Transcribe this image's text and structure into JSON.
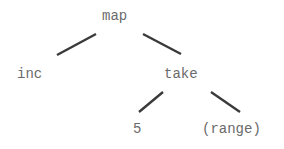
{
  "tree": {
    "nodes": [
      {
        "id": "map",
        "label": "map",
        "x": 102,
        "y": 9
      },
      {
        "id": "inc",
        "label": "inc",
        "x": 17,
        "y": 67
      },
      {
        "id": "take",
        "label": "take",
        "x": 164,
        "y": 67
      },
      {
        "id": "five",
        "label": "5",
        "x": 133,
        "y": 122
      },
      {
        "id": "range",
        "label": "(range)",
        "x": 202,
        "y": 122
      }
    ],
    "edges": [
      {
        "from": "map",
        "to": "inc"
      },
      {
        "from": "map",
        "to": "take"
      },
      {
        "from": "take",
        "to": "five"
      },
      {
        "from": "take",
        "to": "range"
      }
    ]
  },
  "colors": {
    "text": "#6a6a6a",
    "edge": "#3a3a3a",
    "background": "#ffffff"
  }
}
